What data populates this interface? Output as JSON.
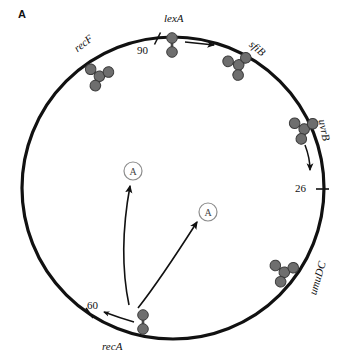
{
  "panel": {
    "label": "A"
  },
  "figure": {
    "type": "circular-genome-map",
    "organism_map": "bacterial chromosome circle",
    "colors": {
      "circle_stroke": "#111111",
      "protein_fill": "#6e6e6e",
      "protein_stroke": "#3d3d3d",
      "arrow": "#111111",
      "text": "#111111",
      "background": "#ffffff"
    },
    "circle": {
      "cx": 173,
      "cy": 188,
      "r": 151,
      "stroke_width": 3
    }
  },
  "gene_labels": [
    {
      "id": "recF",
      "text": "recF",
      "x": 86,
      "y": 44,
      "rotation": -38
    },
    {
      "id": "lexA",
      "text": "lexA",
      "x": 180,
      "y": 18,
      "rotation": 0
    },
    {
      "id": "sfiB",
      "text": "sfiB",
      "x": 259,
      "y": 49,
      "rotation": 40
    },
    {
      "id": "uvrB",
      "text": "uvrB",
      "x": 325,
      "y": 131,
      "rotation": 78
    },
    {
      "id": "umuDC",
      "text": "umuDC",
      "x": 319,
      "y": 280,
      "rotation": 287
    },
    {
      "id": "recA",
      "text": "recA",
      "x": 114,
      "y": 348,
      "rotation": 0
    }
  ],
  "tick_labels": [
    {
      "id": "tick-90",
      "text": "90",
      "x": 144,
      "y": 52
    },
    {
      "id": "tick-26",
      "text": "26",
      "x": 296,
      "y": 190
    },
    {
      "id": "tick-60",
      "text": "60",
      "x": 94,
      "y": 309
    }
  ],
  "activated_signals": [
    {
      "id": "signal-A-upper",
      "text": "A",
      "cx": 133,
      "cy": 171,
      "r": 9
    },
    {
      "id": "signal-A-lower",
      "text": "A",
      "cx": 208,
      "cy": 212,
      "r": 9
    }
  ],
  "protein_complexes": [
    {
      "id": "recF-tetramer",
      "kind": "tetramer",
      "cx": 98,
      "cy": 78
    },
    {
      "id": "lexA-dimer",
      "kind": "dimer",
      "cx": 172,
      "cy": 44
    },
    {
      "id": "sfiB-tetramer",
      "kind": "tetramer",
      "cx": 238,
      "cy": 68
    },
    {
      "id": "uvrB-tetramer",
      "kind": "tetramer",
      "cx": 303,
      "cy": 132
    },
    {
      "id": "umuDC-tetramer",
      "kind": "tetramer",
      "cx": 283,
      "cy": 275
    },
    {
      "id": "recA-dimer",
      "kind": "dimer",
      "cx": 143,
      "cy": 323
    }
  ],
  "arrows": [
    {
      "id": "arrow-lexA-right",
      "description": "lexA to sfiB"
    },
    {
      "id": "arrow-uvrB-down",
      "description": "uvrB downward"
    },
    {
      "id": "arrow-recA-left",
      "description": "recA toward 60"
    },
    {
      "id": "arrow-signal-upper",
      "description": "recA region to upper circled A"
    },
    {
      "id": "arrow-signal-lower",
      "description": "recA region to lower circled A"
    }
  ]
}
